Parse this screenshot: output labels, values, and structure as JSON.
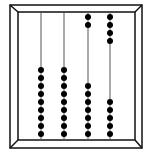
{
  "diagram": {
    "frame": {
      "outer": [
        10,
        5,
        142,
        148
      ],
      "inner": [
        18,
        12,
        135,
        140
      ],
      "stroke": "#111111"
    },
    "rods": [
      {
        "x": 41,
        "top_beads": 0,
        "bottom_beads": 9
      },
      {
        "x": 64,
        "top_beads": 0,
        "bottom_beads": 9
      },
      {
        "x": 88,
        "top_beads": 2,
        "bottom_beads": 7
      },
      {
        "x": 110,
        "top_beads": 4,
        "bottom_beads": 5
      }
    ],
    "bead": {
      "radius": 3,
      "spacing": 8,
      "top_start_y": 17,
      "bottom_end_y": 134,
      "color": "#000000"
    },
    "rod_color": "#555555"
  }
}
